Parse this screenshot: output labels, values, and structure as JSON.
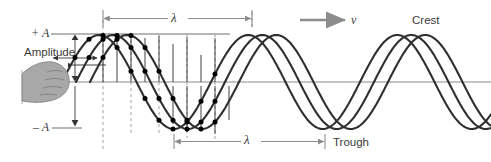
{
  "figure": {
    "width": 491,
    "height": 162
  },
  "labels": {
    "amplitude": "Amplitude",
    "plus_a": "+ A",
    "minus_a": "– A",
    "lambda_top": "λ",
    "lambda_bottom": "λ",
    "velocity": "v",
    "crest": "Crest",
    "trough": "Trough"
  },
  "colors": {
    "wave_stroke": "#2f2f2f",
    "axis_line": "#8c8c8c",
    "dimension_line": "#8c8c8c",
    "dashed_guide": "#9a9a9a",
    "marker_dot": "#000000",
    "hand_fill": "#a8a8a8",
    "hand_stroke": "#6e6e6e",
    "text": "#3b3b3b",
    "background": "#ffffff"
  },
  "chart_data": {
    "type": "line",
    "xlabel": "",
    "ylabel": "Displacement",
    "grid": false,
    "legend": null,
    "axis": {
      "equilibrium_y": 82,
      "plus_amplitude_y": 34,
      "minus_amplitude_y": 128,
      "amplitude_value": "A",
      "x_start": 60,
      "x_end": 491
    },
    "annotations": [
      {
        "name": "wavelength-top",
        "label": "λ",
        "x1": 103,
        "x2": 252,
        "y": 18
      },
      {
        "name": "wavelength-bottom",
        "label": "λ",
        "x1": 174,
        "x2": 325,
        "y": 141
      },
      {
        "name": "velocity-arrow",
        "label": "v",
        "x1": 300,
        "x2": 346,
        "y": 20
      },
      {
        "name": "crest-label",
        "label": "Crest",
        "x": 412,
        "y": 20
      },
      {
        "name": "trough-label",
        "label": "Trough",
        "x": 333,
        "y": 141
      },
      {
        "name": "amplitude-bracket",
        "label": "Amplitude",
        "x": 75,
        "y1": 34,
        "y2": 128
      }
    ],
    "series": [
      {
        "name": "wave-snapshot-1",
        "phase_offset_px": 0,
        "amplitude_px": 47,
        "wavelength_px": 149,
        "start_x": 62,
        "end_x": 491
      },
      {
        "name": "wave-snapshot-2",
        "phase_offset_px": 14,
        "amplitude_px": 47,
        "wavelength_px": 149,
        "start_x": 76,
        "end_x": 491
      },
      {
        "name": "wave-snapshot-3",
        "phase_offset_px": 28,
        "amplitude_px": 47,
        "wavelength_px": 149,
        "start_x": 90,
        "end_x": 491
      }
    ],
    "marker_columns_x": [
      75,
      89,
      103,
      117,
      131,
      145,
      159,
      173,
      187,
      201,
      215
    ],
    "dashed_guide_x": [
      103,
      131,
      159,
      187,
      215,
      252
    ]
  }
}
